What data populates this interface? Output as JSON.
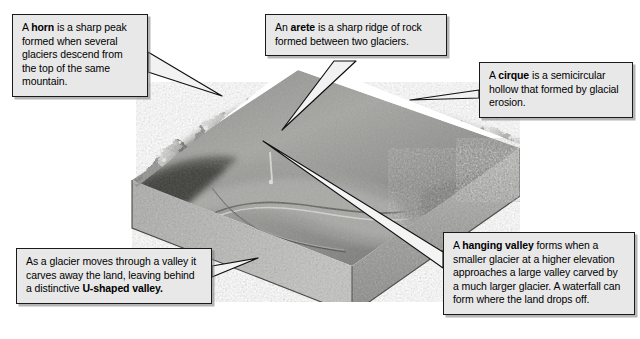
{
  "figure": {
    "image_name": "glaciated-mountain-valley-terrain",
    "background_color": "#ffffff",
    "box_fill_color": "#e8e8e8",
    "box_border_color": "#1a1a1a"
  },
  "callouts": [
    {
      "id": "horn",
      "term": "horn",
      "text_before": "A ",
      "text_after": " is a sharp peak formed when several glaciers descend from the top of the same mountain.",
      "full_text": "A horn is a sharp peak formed when several glaciers descend from the top of the same mountain."
    },
    {
      "id": "arete",
      "term": "arete",
      "text_before": "An ",
      "text_after": " is a sharp ridge of rock formed between two glaciers.",
      "full_text": "An arete is a sharp ridge of rock formed between two glaciers."
    },
    {
      "id": "cirque",
      "term": "cirque",
      "text_before": "A ",
      "text_after": " is a semicircular hollow that formed by glacial erosion.",
      "full_text": "A cirque is a semicircular hollow that formed by glacial erosion."
    },
    {
      "id": "u-shaped-valley",
      "term": "U-shaped valley.",
      "text_before": "As a glacier moves through a valley it carves away the land, leaving behind a distinctive ",
      "text_after": "",
      "full_text": "As a glacier moves through a valley it carves away the land, leaving behind a distinctive U-shaped valley."
    },
    {
      "id": "hanging-valley",
      "term": "hanging valley",
      "text_before": "A ",
      "text_after": " forms when a smaller glacier at a higher elevation approaches a large valley carved by a much larger glacier. A waterfall can form where the land drops off.",
      "full_text": "A hanging valley forms when a smaller glacier at a higher elevation approaches a large valley carved by a much larger glacier. A waterfall can form where the land drops off."
    }
  ]
}
